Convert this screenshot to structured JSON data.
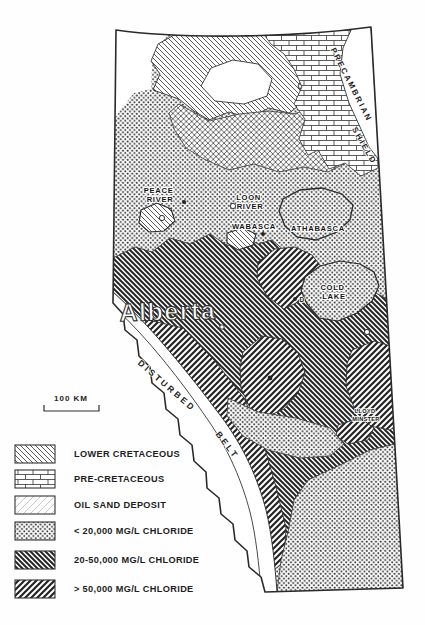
{
  "figure": {
    "cropped_header": "___ __ ___ ______ ___"
  },
  "map": {
    "labels": {
      "peace_river_line1": "PEACE",
      "peace_river_line2": "RIVER",
      "loon_river_line1": "LOON",
      "loon_river_line2": "RIVER",
      "wabasca": "WABASCA",
      "athabasca": "ATHABASCA",
      "cold_lake_line1": "COLD",
      "cold_lake_line2": "LAKE",
      "province": "Alberta",
      "disturbed": "DISTURBED",
      "belt": "BELT",
      "precambrian": "PRECAMBRIAN",
      "shield": "SHIELD",
      "lloydminster_line1": "LLOYD",
      "lloydminster_line2": "MINSTER",
      "marker_d": "D"
    },
    "scale_label": "100 KM"
  },
  "legend": {
    "items": [
      {
        "label": "LOWER CRETACEOUS",
        "pattern": "thin-back-hatch"
      },
      {
        "label": "PRE-CRETACEOUS",
        "pattern": "brick"
      },
      {
        "label": "OIL SAND DEPOSIT",
        "pattern": "oil-sand"
      },
      {
        "label": "< 20,000 MG/L CHLORIDE",
        "pattern": "dots"
      },
      {
        "label": "20-50,000 MG/L CHLORIDE",
        "pattern": "thick-back-hatch"
      },
      {
        "label": "> 50,000 MG/L CHLORIDE",
        "pattern": "thick-fwd-hatch"
      }
    ]
  }
}
